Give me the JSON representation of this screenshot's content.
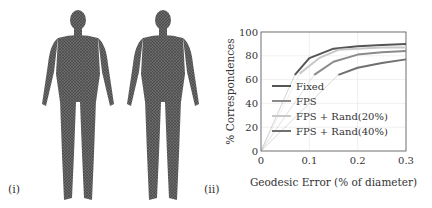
{
  "panels": {
    "left_label": "(i)",
    "right_label": "(ii)"
  },
  "chart_data": {
    "type": "line",
    "title": "",
    "xlabel": "Geodesic Error (% of diameter)",
    "ylabel": "% Correspondences",
    "xlim": [
      0,
      0.3
    ],
    "ylim": [
      0,
      100
    ],
    "xticks": [
      "0",
      "0.1",
      "0.2",
      "0.3"
    ],
    "yticks": [
      "0",
      "20",
      "40",
      "60",
      "80",
      "100"
    ],
    "grid": true,
    "legend_position": "lower left inside",
    "series": [
      {
        "name": "Fixed",
        "color": "#555555",
        "x": [
          0,
          0.07,
          0.1,
          0.15,
          0.2,
          0.25,
          0.3
        ],
        "values": [
          0,
          64,
          78,
          86,
          88,
          89,
          90
        ]
      },
      {
        "name": "FPS",
        "color": "#8a8a8a",
        "x": [
          0,
          0.11,
          0.15,
          0.2,
          0.25,
          0.3
        ],
        "values": [
          0,
          64,
          75,
          81,
          83,
          84
        ]
      },
      {
        "name": "FPS + Rand(20%)",
        "color": "#c8c8c8",
        "x": [
          0,
          0.08,
          0.12,
          0.16,
          0.2,
          0.25,
          0.3
        ],
        "values": [
          0,
          65,
          78,
          85,
          86,
          87,
          87
        ]
      },
      {
        "name": "FPS + Rand(40%)",
        "color": "#707070",
        "x": [
          0,
          0.16,
          0.2,
          0.25,
          0.3
        ],
        "values": [
          0,
          64,
          70,
          74,
          77
        ]
      }
    ]
  }
}
